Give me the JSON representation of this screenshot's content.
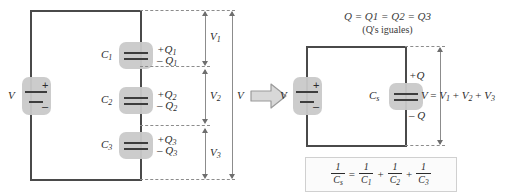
{
  "figure": {
    "title_note_line1": "Q = Q1 = Q2 = Q3",
    "title_note_line2": "(Q's iguales)"
  },
  "left_circuit": {
    "source_label": "V",
    "source_plus": "+",
    "source_minus": "–",
    "capacitors": [
      {
        "name": "C1",
        "label": "C",
        "sub": "1",
        "charge_pos": "+Q",
        "charge_pos_sub": "1",
        "charge_neg": "– Q",
        "charge_neg_sub": "1"
      },
      {
        "name": "C2",
        "label": "C",
        "sub": "2",
        "charge_pos": "+Q",
        "charge_pos_sub": "2",
        "charge_neg": "– Q",
        "charge_neg_sub": "2"
      },
      {
        "name": "C3",
        "label": "C",
        "sub": "3",
        "charge_pos": "+Q",
        "charge_pos_sub": "3",
        "charge_neg": "– Q",
        "charge_neg_sub": "3"
      }
    ],
    "dimensions": [
      {
        "name": "V1",
        "label": "V",
        "sub": "1"
      },
      {
        "name": "V2",
        "label": "V",
        "sub": "2"
      },
      {
        "name": "V3",
        "label": "V",
        "sub": "3"
      }
    ],
    "total_dimension": {
      "name": "V",
      "label": "V",
      "sub": ""
    }
  },
  "transition": {
    "arrow_name": "right-arrow"
  },
  "right_circuit": {
    "source_label": "V",
    "source_plus": "+",
    "source_minus": "–",
    "capacitor": {
      "label": "C",
      "sub": "s",
      "charge_pos": "+Q",
      "charge_neg": "– Q"
    },
    "voltage_equation": {
      "lhs": "V",
      "eq": "=",
      "t1": "V",
      "t1sub": "1",
      "plus1": "+",
      "t2": "V",
      "t2sub": "2",
      "plus2": "+",
      "t3": "V",
      "t3sub": "3"
    }
  },
  "formula": {
    "lhs_num": "1",
    "lhs_den": "C",
    "lhs_den_sub": "s",
    "equals": "=",
    "t1_num": "1",
    "t1_den": "C",
    "t1_den_sub": "1",
    "plus1": "+",
    "t2_num": "1",
    "t2_den": "C",
    "t2_den_sub": "2",
    "plus2": "+",
    "t3_num": "1",
    "t3_den": "C",
    "t3_den_sub": "3"
  },
  "colors": {
    "wire": "#4a4a4a",
    "dashed": "#8c8c8c",
    "pill": "#c9c9c9",
    "plate": "#3d3d3d",
    "text": "#2b2b2b",
    "arrow_fill": "#d8d8d8",
    "arrow_stroke": "#9a9a9a"
  }
}
